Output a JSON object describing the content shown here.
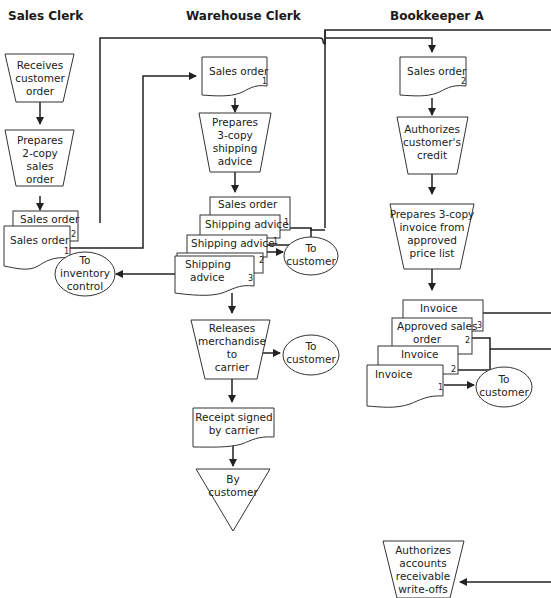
{
  "columns": [
    {
      "title": "Sales Clerk"
    },
    {
      "title": "Warehouse Clerk"
    },
    {
      "title": "Bookkeeper A"
    }
  ],
  "sales_clerk": {
    "receive": [
      "Receives",
      "customer",
      "order"
    ],
    "prepare": [
      "Prepares",
      "2-copy",
      "sales",
      "order"
    ],
    "doc_copy2": {
      "label": "Sales order",
      "num": "2"
    },
    "doc_copy1": {
      "label": "Sales order",
      "num": "1"
    },
    "to_inventory": [
      "To",
      "inventory",
      "control"
    ]
  },
  "warehouse_clerk": {
    "sales_order_doc": {
      "label": "Sales order",
      "num": "1"
    },
    "prepare": [
      "Prepares",
      "3-copy",
      "shipping",
      "advice"
    ],
    "stack": [
      {
        "label": "Sales order",
        "num": ""
      },
      {
        "label": "Shipping advice",
        "num": "1"
      },
      {
        "label": "Shipping advice",
        "num": "1"
      },
      {
        "label": "Shipping advice",
        "num": "2"
      },
      {
        "label": [
          "Shipping",
          "advice"
        ],
        "num": "3"
      }
    ],
    "to_customer_1": [
      "To",
      "customer"
    ],
    "release": [
      "Releases",
      "merchandise",
      "to",
      "carrier"
    ],
    "to_customer_2": [
      "To",
      "customer"
    ],
    "receipt": [
      "Receipt signed",
      "by carrier"
    ],
    "file": [
      "By",
      "customer"
    ]
  },
  "bookkeeper": {
    "sales_order_doc": {
      "label": "Sales order",
      "num": "2"
    },
    "authorize": [
      "Authorizes",
      "customer's",
      "credit"
    ],
    "prepare": [
      "Prepares 3-copy",
      "invoice from",
      "approved",
      "price list"
    ],
    "stack": [
      {
        "label": "Invoice",
        "num": "3"
      },
      {
        "label": [
          "Approved sales",
          "order"
        ],
        "num": "2"
      },
      {
        "label": "Invoice",
        "num": "2"
      },
      {
        "label": "Invoice",
        "num": "1"
      }
    ],
    "to_customer": [
      "To",
      "customer"
    ],
    "writeoffs": [
      "Authorizes",
      "accounts",
      "receivable",
      "write-offs"
    ]
  }
}
